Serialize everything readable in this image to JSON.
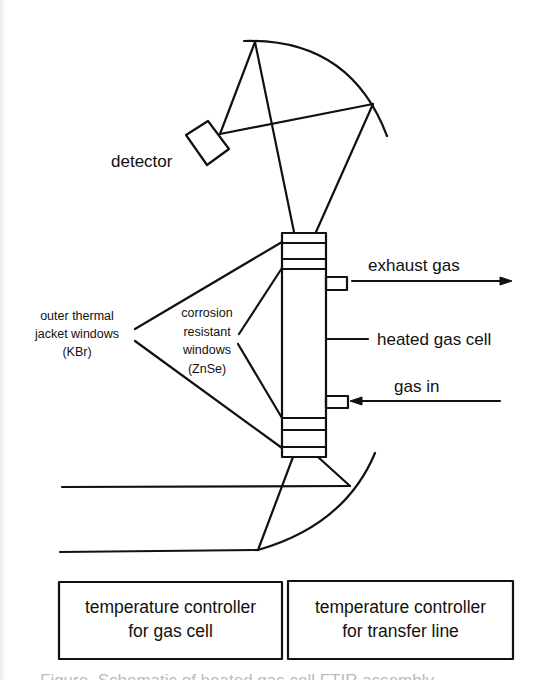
{
  "figure": {
    "labels": {
      "detector": "detector",
      "exhaust_gas": "exhaust gas",
      "heated_gas_cell": "heated gas cell",
      "gas_in": "gas in",
      "outer_windows": [
        "outer thermal",
        "jacket windows",
        "(KBr)"
      ],
      "inner_windows": [
        "corrosion",
        "resistant",
        "windows",
        "(ZnSe)"
      ]
    },
    "boxes": [
      {
        "line1": "temperature controller",
        "line2": "for gas cell"
      },
      {
        "line1": "temperature controller",
        "line2": "for transfer line"
      }
    ],
    "caption_partial": "Figure. Schematic of heated gas cell FTIR assembly"
  }
}
